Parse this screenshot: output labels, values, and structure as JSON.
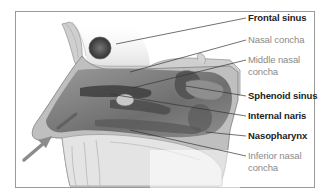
{
  "diagram": {
    "colors": {
      "frame": "#9a9a9a",
      "label_primary": "#222222",
      "label_secondary": "#8a8a8a",
      "airflow_arrow": "#8c8c8c"
    },
    "labels": [
      {
        "id": "frontal-sinus",
        "text": "Frontal sinus",
        "style": "dark"
      },
      {
        "id": "nasal-concha",
        "text": "Nasal concha",
        "style": "light"
      },
      {
        "id": "middle-nasal-concha",
        "text": "Middle nasal concha",
        "line1": "Middle nasal",
        "line2": "concha",
        "style": "light"
      },
      {
        "id": "sphenoid-sinus",
        "text": "Sphenoid sinus",
        "style": "dark"
      },
      {
        "id": "internal-naris",
        "text": "Internal naris",
        "style": "dark"
      },
      {
        "id": "nasopharynx",
        "text": "Nasopharynx",
        "style": "dark"
      },
      {
        "id": "inferior-nasal-concha",
        "text": "Inferior nasal concha",
        "line1": "Inferior nasal",
        "line2": "concha",
        "style": "light"
      }
    ],
    "arrows": [
      {
        "id": "airflow-arrow-lower",
        "meaning": "air entering nostril"
      },
      {
        "id": "airflow-arrow-upper",
        "meaning": "air entering nostril"
      }
    ]
  }
}
